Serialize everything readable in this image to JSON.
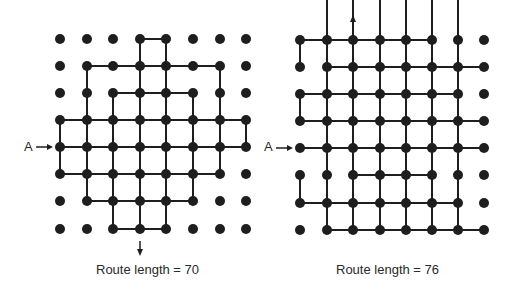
{
  "colors": {
    "ink": "#1e1e1e",
    "background": "#ffffff"
  },
  "diagrams": [
    {
      "id": "left",
      "caption": "Route length = 70",
      "entry_label": "A",
      "cols_x": [
        60,
        87,
        113,
        140,
        166,
        193,
        220,
        246
      ],
      "rows_y": [
        39,
        66,
        93,
        120,
        147,
        174,
        201,
        229
      ],
      "entry": {
        "row": 4,
        "side": "left"
      },
      "exit": {
        "col": 3,
        "direction": "down"
      },
      "h_edges": [
        [
          0,
          3
        ],
        [
          1,
          1
        ],
        [
          1,
          2
        ],
        [
          1,
          3
        ],
        [
          1,
          4
        ],
        [
          1,
          5
        ],
        [
          2,
          2
        ],
        [
          2,
          3
        ],
        [
          2,
          4
        ],
        [
          3,
          0
        ],
        [
          3,
          1
        ],
        [
          3,
          2
        ],
        [
          3,
          3
        ],
        [
          3,
          4
        ],
        [
          3,
          5
        ],
        [
          3,
          6
        ],
        [
          4,
          0
        ],
        [
          4,
          1
        ],
        [
          4,
          2
        ],
        [
          4,
          3
        ],
        [
          4,
          4
        ],
        [
          4,
          5
        ],
        [
          4,
          6
        ],
        [
          5,
          0
        ],
        [
          5,
          1
        ],
        [
          5,
          2
        ],
        [
          5,
          3
        ],
        [
          5,
          4
        ],
        [
          5,
          5
        ],
        [
          6,
          1
        ],
        [
          6,
          2
        ],
        [
          6,
          3
        ],
        [
          6,
          4
        ],
        [
          7,
          2
        ],
        [
          7,
          3
        ]
      ],
      "v_edges": [
        [
          0,
          3
        ],
        [
          0,
          4
        ],
        [
          1,
          1
        ],
        [
          1,
          3
        ],
        [
          1,
          4
        ],
        [
          1,
          6
        ],
        [
          2,
          1
        ],
        [
          2,
          2
        ],
        [
          2,
          3
        ],
        [
          2,
          4
        ],
        [
          2,
          5
        ],
        [
          2,
          6
        ],
        [
          3,
          0
        ],
        [
          3,
          1
        ],
        [
          3,
          2
        ],
        [
          3,
          3
        ],
        [
          3,
          4
        ],
        [
          3,
          5
        ],
        [
          3,
          6
        ],
        [
          3,
          7
        ],
        [
          4,
          0
        ],
        [
          4,
          1
        ],
        [
          4,
          2
        ],
        [
          4,
          3
        ],
        [
          4,
          4
        ],
        [
          4,
          5
        ],
        [
          4,
          6
        ],
        [
          5,
          1
        ],
        [
          5,
          2
        ],
        [
          5,
          3
        ],
        [
          5,
          4
        ],
        [
          5,
          5
        ],
        [
          6,
          2
        ],
        [
          6,
          3
        ],
        [
          6,
          4
        ]
      ],
      "caption_pos": {
        "x": 96,
        "y": 262
      },
      "label_pos": {
        "x": 24,
        "y": 139
      }
    },
    {
      "id": "right",
      "caption": "Route length = 76",
      "entry_label": "A",
      "cols_x": [
        300,
        327,
        353,
        380,
        406,
        432,
        458,
        484
      ],
      "rows_y": [
        40,
        67,
        94,
        121,
        148,
        175,
        203,
        230
      ],
      "entry": {
        "row": 4,
        "side": "left"
      },
      "exit": {
        "col": 2,
        "direction": "up"
      },
      "h_edges": [
        [
          0,
          0
        ],
        [
          0,
          1
        ],
        [
          0,
          2
        ],
        [
          0,
          3
        ],
        [
          0,
          4
        ],
        [
          1,
          1
        ],
        [
          1,
          2
        ],
        [
          1,
          3
        ],
        [
          1,
          4
        ],
        [
          1,
          5
        ],
        [
          1,
          6
        ],
        [
          2,
          0
        ],
        [
          2,
          1
        ],
        [
          2,
          2
        ],
        [
          2,
          3
        ],
        [
          2,
          4
        ],
        [
          2,
          5
        ],
        [
          3,
          0
        ],
        [
          3,
          1
        ],
        [
          3,
          2
        ],
        [
          3,
          3
        ],
        [
          3,
          4
        ],
        [
          3,
          5
        ],
        [
          3,
          6
        ],
        [
          4,
          0
        ],
        [
          4,
          1
        ],
        [
          4,
          2
        ],
        [
          4,
          3
        ],
        [
          4,
          4
        ],
        [
          4,
          5
        ],
        [
          4,
          6
        ],
        [
          5,
          2
        ],
        [
          5,
          3
        ],
        [
          5,
          4
        ],
        [
          6,
          0
        ],
        [
          6,
          1
        ],
        [
          6,
          2
        ],
        [
          6,
          3
        ],
        [
          6,
          4
        ],
        [
          6,
          5
        ],
        [
          7,
          1
        ],
        [
          7,
          2
        ],
        [
          7,
          3
        ],
        [
          7,
          4
        ],
        [
          7,
          5
        ],
        [
          7,
          6
        ]
      ],
      "v_edges": [
        [
          0,
          0
        ],
        [
          0,
          1
        ],
        [
          0,
          3
        ],
        [
          0,
          4
        ],
        [
          0,
          5
        ],
        [
          1,
          1
        ],
        [
          1,
          2
        ],
        [
          1,
          3
        ],
        [
          1,
          4
        ],
        [
          1,
          5
        ],
        [
          1,
          6
        ],
        [
          2,
          0
        ],
        [
          2,
          1
        ],
        [
          2,
          2
        ],
        [
          2,
          3
        ],
        [
          2,
          4
        ],
        [
          5,
          0
        ],
        [
          5,
          1
        ],
        [
          5,
          2
        ],
        [
          5,
          3
        ],
        [
          6,
          2
        ],
        [
          6,
          3
        ],
        [
          6,
          4
        ],
        [
          6,
          5
        ],
        [
          7,
          1
        ],
        [
          7,
          2
        ],
        [
          7,
          3
        ],
        [
          7,
          4
        ],
        [
          7,
          5
        ],
        [
          7,
          6
        ]
      ],
      "caption_pos": {
        "x": 336,
        "y": 262
      },
      "label_pos": {
        "x": 264,
        "y": 139
      }
    }
  ]
}
